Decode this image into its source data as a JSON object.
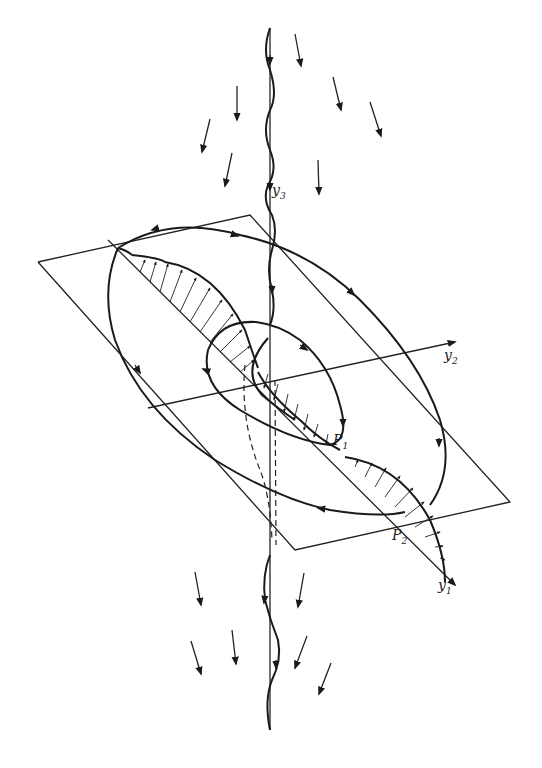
{
  "figure": {
    "type": "3D flow diagram",
    "axes": {
      "y1": {
        "label": "y",
        "sub": "1"
      },
      "y2": {
        "label": "y",
        "sub": "2"
      },
      "y3": {
        "label": "y",
        "sub": "3"
      }
    },
    "points": {
      "p1": {
        "label": "P",
        "sub": "1"
      },
      "p2": {
        "label": "P",
        "sub": "2"
      }
    },
    "colors": {
      "ink": "#1a1a1a",
      "background": "#ffffff"
    }
  }
}
